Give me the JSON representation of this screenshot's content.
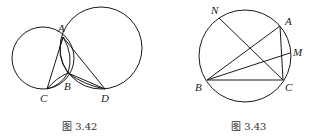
{
  "figures": [
    {
      "caption": "图 3.42",
      "labels": {
        "A": "A",
        "B": "B",
        "C": "C",
        "D": "D"
      }
    },
    {
      "caption": "图 3.43",
      "labels": {
        "N": "N",
        "A": "A",
        "M": "M",
        "B": "B",
        "C": "C"
      }
    }
  ],
  "colors": {
    "line": "#1a1a1a",
    "caption": "#333333",
    "background": "#ffffff"
  }
}
